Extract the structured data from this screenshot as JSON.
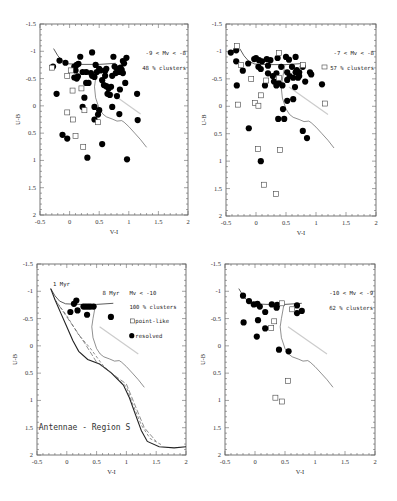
{
  "chart_data": [
    {
      "type": "scatter",
      "panel": "top-left",
      "title": "",
      "xlabel": "V-I",
      "ylabel": "U-B",
      "xlim": [
        -0.5,
        2
      ],
      "ylim": [
        -1.5,
        2
      ],
      "y_inverted": true,
      "xticks": [
        "-0.5",
        "0",
        "0.5",
        "1",
        "1.5",
        "2"
      ],
      "yticks": [
        "-1.5",
        "-1",
        "-0.5",
        "0",
        "0.5",
        "1",
        "1.5",
        "2"
      ],
      "annotations": [
        "-9 < Mv < -8",
        "48 % clusters"
      ],
      "series": [
        {
          "name": "resolved",
          "marker": "filled-circle",
          "points": [
            [
              -0.28,
              -0.72
            ],
            [
              -0.17,
              -0.83
            ],
            [
              -0.07,
              -0.79
            ],
            [
              0.08,
              -0.72
            ],
            [
              0.12,
              -0.75
            ],
            [
              0.15,
              -0.77
            ],
            [
              0.18,
              -0.9
            ],
            [
              0.22,
              -0.62
            ],
            [
              0.1,
              -0.65
            ],
            [
              0.08,
              -0.52
            ],
            [
              0.12,
              -0.5
            ],
            [
              0.14,
              -0.54
            ],
            [
              0.28,
              -0.42
            ],
            [
              0.32,
              -0.42
            ],
            [
              0.38,
              -0.98
            ],
            [
              0.38,
              -0.55
            ],
            [
              0.42,
              -0.53
            ],
            [
              0.44,
              -0.75
            ],
            [
              0.46,
              -0.62
            ],
            [
              0.5,
              -0.68
            ],
            [
              0.52,
              -0.65
            ],
            [
              0.55,
              -0.47
            ],
            [
              0.58,
              -0.38
            ],
            [
              0.6,
              -0.64
            ],
            [
              0.62,
              -0.68
            ],
            [
              0.62,
              -0.36
            ],
            [
              0.66,
              -0.32
            ],
            [
              0.64,
              -0.22
            ],
            [
              0.68,
              -0.2
            ],
            [
              0.7,
              -0.35
            ],
            [
              0.72,
              -0.55
            ],
            [
              0.74,
              -0.9
            ],
            [
              0.76,
              -0.72
            ],
            [
              0.78,
              -0.6
            ],
            [
              0.8,
              -0.68
            ],
            [
              0.82,
              -0.66
            ],
            [
              0.84,
              -0.62
            ],
            [
              0.86,
              -0.7
            ],
            [
              0.88,
              -0.66
            ],
            [
              0.9,
              -0.82
            ],
            [
              0.92,
              -0.78
            ],
            [
              0.96,
              -0.88
            ],
            [
              0.94,
              -0.42
            ],
            [
              0.85,
              -0.3
            ],
            [
              0.8,
              -0.18
            ],
            [
              0.25,
              -0.15
            ],
            [
              0.22,
              0.02
            ],
            [
              0.42,
              0.02
            ],
            [
              0.5,
              0.08
            ],
            [
              0.48,
              0.16
            ],
            [
              0.42,
              0.25
            ],
            [
              0.72,
              0.02
            ],
            [
              0.84,
              0.15
            ],
            [
              1.14,
              -0.22
            ],
            [
              1.15,
              0.26
            ],
            [
              -0.22,
              -0.22
            ],
            [
              -0.12,
              0.53
            ],
            [
              -0.04,
              0.6
            ],
            [
              0.55,
              0.7
            ],
            [
              0.3,
              0.95
            ],
            [
              0.97,
              0.98
            ],
            [
              0.9,
              -0.6
            ],
            [
              0.6,
              -0.55
            ],
            [
              0.36,
              -0.6
            ],
            [
              0.28,
              -0.62
            ]
          ]
        },
        {
          "name": "point-like",
          "marker": "open-square",
          "points": [
            [
              -0.3,
              -0.7
            ],
            [
              0.02,
              -0.65
            ],
            [
              -0.04,
              -0.55
            ],
            [
              0.05,
              -0.28
            ],
            [
              0.2,
              -0.32
            ],
            [
              0.25,
              0.08
            ],
            [
              -0.04,
              0.12
            ],
            [
              0.06,
              0.25
            ],
            [
              0.1,
              0.55
            ],
            [
              0.23,
              0.75
            ],
            [
              0.48,
              0.3
            ]
          ]
        }
      ],
      "model_lines": 1
    },
    {
      "type": "scatter",
      "panel": "top-right",
      "title": "",
      "xlabel": "V-I",
      "ylabel": "U-B",
      "xlim": [
        -0.5,
        2
      ],
      "ylim": [
        -1.5,
        2
      ],
      "y_inverted": true,
      "xticks": [
        "-0.5",
        "0",
        "0.5",
        "1",
        "1.5",
        "2"
      ],
      "yticks": [
        "-1.5",
        "-1",
        "-0.5",
        "0",
        "0.5",
        "1",
        "1.5",
        "2"
      ],
      "annotations": [
        "-7 < Mv < -8",
        "57 % clusters"
      ],
      "series": [
        {
          "name": "resolved",
          "marker": "filled-circle",
          "points": [
            [
              -0.42,
              -0.98
            ],
            [
              -0.33,
              -1.02
            ],
            [
              -0.33,
              -0.82
            ],
            [
              -0.13,
              -0.78
            ],
            [
              -0.22,
              -0.65
            ],
            [
              -0.03,
              -0.86
            ],
            [
              0.0,
              -0.88
            ],
            [
              0.04,
              -0.72
            ],
            [
              0.05,
              -0.84
            ],
            [
              0.08,
              -0.68
            ],
            [
              0.1,
              -0.82
            ],
            [
              0.18,
              -0.86
            ],
            [
              0.2,
              -0.74
            ],
            [
              0.2,
              -0.6
            ],
            [
              0.24,
              -0.84
            ],
            [
              0.28,
              -0.55
            ],
            [
              0.3,
              -0.45
            ],
            [
              0.34,
              -0.6
            ],
            [
              0.36,
              -0.88
            ],
            [
              0.38,
              -0.42
            ],
            [
              0.42,
              -0.72
            ],
            [
              0.44,
              -0.38
            ],
            [
              0.5,
              -0.9
            ],
            [
              0.52,
              -0.62
            ],
            [
              0.52,
              -0.48
            ],
            [
              0.55,
              -0.85
            ],
            [
              0.56,
              -0.55
            ],
            [
              0.6,
              -0.72
            ],
            [
              0.62,
              -0.52
            ],
            [
              0.66,
              -0.9
            ],
            [
              0.66,
              -0.62
            ],
            [
              0.68,
              -0.66
            ],
            [
              0.7,
              -0.52
            ],
            [
              0.72,
              -0.62
            ],
            [
              0.78,
              -0.72
            ],
            [
              0.82,
              -0.45
            ],
            [
              0.9,
              -0.62
            ],
            [
              0.92,
              -0.58
            ],
            [
              0.72,
              -0.55
            ],
            [
              0.65,
              -0.35
            ],
            [
              1.1,
              -0.4
            ],
            [
              -0.32,
              -0.38
            ],
            [
              0.15,
              -0.38
            ],
            [
              0.34,
              -0.38
            ],
            [
              0.62,
              -0.13
            ],
            [
              0.52,
              -0.1
            ],
            [
              0.45,
              0.05
            ],
            [
              0.37,
              0.23
            ],
            [
              0.47,
              0.23
            ],
            [
              0.78,
              0.45
            ],
            [
              0.85,
              0.58
            ],
            [
              -0.12,
              0.4
            ],
            [
              0.08,
              1.0
            ]
          ]
        },
        {
          "name": "point-like",
          "marker": "open-square",
          "points": [
            [
              -0.32,
              -1.1
            ],
            [
              -0.25,
              -0.75
            ],
            [
              -0.08,
              -0.5
            ],
            [
              0.17,
              -0.47
            ],
            [
              0.38,
              -0.97
            ],
            [
              0.38,
              -0.52
            ],
            [
              0.08,
              -0.2
            ],
            [
              -0.3,
              -0.03
            ],
            [
              -0.02,
              -0.06
            ],
            [
              0.04,
              -0.01
            ],
            [
              1.15,
              -0.05
            ],
            [
              0.03,
              0.78
            ],
            [
              0.4,
              0.8
            ],
            [
              0.13,
              1.43
            ],
            [
              0.33,
              1.6
            ],
            [
              0.78,
              -0.75
            ]
          ]
        }
      ],
      "model_lines": 1
    },
    {
      "type": "scatter",
      "panel": "bottom-left",
      "title": "",
      "xlabel": "V-I",
      "ylabel": "U-B",
      "xlim": [
        -0.5,
        2
      ],
      "ylim": [
        -1.5,
        2
      ],
      "y_inverted": true,
      "xticks": [
        "-0.5",
        "0",
        "0.5",
        "1",
        "1.5",
        "2"
      ],
      "yticks": [
        "-1.5",
        "-1",
        "-0.5",
        "0",
        "0.5",
        "1",
        "1.5",
        "2"
      ],
      "annotations": [
        "1 Myr",
        "8 Myr",
        "Mv < -10",
        "100 % clusters",
        "Antennae - Region S"
      ],
      "legend": [
        {
          "marker": "open-square",
          "label": "point-like"
        },
        {
          "marker": "filled-circle",
          "label": "resolved"
        }
      ],
      "series": [
        {
          "name": "resolved",
          "marker": "filled-circle",
          "points": [
            [
              0.12,
              -0.77
            ],
            [
              0.16,
              -0.83
            ],
            [
              0.18,
              -0.65
            ],
            [
              0.06,
              -0.62
            ],
            [
              0.28,
              -0.72
            ],
            [
              0.32,
              -0.72
            ],
            [
              0.36,
              -0.72
            ],
            [
              0.4,
              -0.72
            ],
            [
              0.45,
              -0.72
            ],
            [
              0.34,
              -0.57
            ],
            [
              0.74,
              -0.53
            ]
          ]
        },
        {
          "name": "point-like",
          "marker": "open-square",
          "points": []
        }
      ],
      "model_lines": 4
    },
    {
      "type": "scatter",
      "panel": "bottom-right",
      "title": "",
      "xlabel": "V-I",
      "ylabel": "U-B",
      "xlim": [
        -0.5,
        2
      ],
      "ylim": [
        -1.5,
        2
      ],
      "y_inverted": true,
      "xticks": [
        "-0.5",
        "0",
        "0.5",
        "1",
        "1.5",
        "2"
      ],
      "yticks": [
        "-1.5",
        "-1",
        "-0.5",
        "0",
        "0.5",
        "1",
        "1.5",
        "2"
      ],
      "annotations": [
        "-10 < Mv < -9",
        "62 % clusters"
      ],
      "series": [
        {
          "name": "resolved",
          "marker": "filled-circle",
          "points": [
            [
              -0.2,
              -0.92
            ],
            [
              -0.1,
              -0.82
            ],
            [
              -0.02,
              -0.76
            ],
            [
              0.04,
              -0.77
            ],
            [
              0.08,
              -0.72
            ],
            [
              0.17,
              -0.62
            ],
            [
              0.28,
              -0.76
            ],
            [
              0.36,
              -0.7
            ],
            [
              0.37,
              -0.75
            ],
            [
              0.7,
              -0.74
            ],
            [
              0.7,
              -0.6
            ],
            [
              0.78,
              -0.64
            ],
            [
              -0.19,
              -0.43
            ],
            [
              0.05,
              -0.47
            ],
            [
              0.17,
              -0.32
            ],
            [
              0.03,
              -0.17
            ],
            [
              0.4,
              0.07
            ],
            [
              0.56,
              0.1
            ]
          ]
        },
        {
          "name": "point-like",
          "marker": "open-square",
          "points": [
            [
              0.45,
              -0.78
            ],
            [
              0.32,
              -0.45
            ],
            [
              0.27,
              -0.33
            ],
            [
              0.62,
              -0.67
            ],
            [
              0.55,
              0.64
            ],
            [
              0.34,
              0.95
            ],
            [
              0.45,
              1.02
            ]
          ]
        }
      ],
      "model_lines": 1
    }
  ],
  "panels": [
    {
      "id": "tl",
      "box": {
        "left": 40,
        "top": 24,
        "width": 148,
        "height": 191
      },
      "labels": {
        "annot1": "-9 < Mv < -8",
        "annot2": "48 % clusters"
      }
    },
    {
      "id": "tr",
      "box": {
        "left": 226,
        "top": 24,
        "width": 150,
        "height": 192
      },
      "labels": {
        "annot1": "-7 < Mv < -8",
        "annot2": "57 % clusters"
      }
    },
    {
      "id": "bl",
      "box": {
        "left": 37,
        "top": 264,
        "width": 149,
        "height": 191
      },
      "labels": {
        "annot1": "Mv < -10",
        "annot2": "100 % clusters",
        "age1": "1 Myr",
        "age2": "8 Myr",
        "legend1": "point-like",
        "legend2": "resolved",
        "region": "Antennae - Region S"
      }
    },
    {
      "id": "br",
      "box": {
        "left": 225,
        "top": 264,
        "width": 150,
        "height": 191
      },
      "labels": {
        "annot1": "-10 < Mv < -9",
        "annot2": "62 % clusters"
      }
    }
  ],
  "axes": {
    "xlabel": "V-I",
    "ylabel": "U-B",
    "xticks": [
      "-0.5",
      "0",
      "0.5",
      "1",
      "1.5",
      "2"
    ],
    "yticks": [
      "-1.5",
      "-1",
      "-0.5",
      "0",
      "0.5",
      "1",
      "1.5",
      "2"
    ]
  }
}
